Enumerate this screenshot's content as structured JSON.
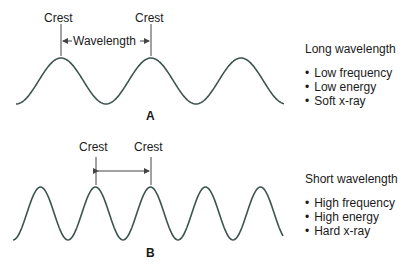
{
  "colors": {
    "wave": "#3d5450",
    "marker": "#444444",
    "text": "#1a1a1a"
  },
  "panel_a": {
    "letter": "A",
    "crest_left": "Crest",
    "crest_right": "Crest",
    "span_label": "Wavelength",
    "wave": {
      "start_x": 16,
      "crest_y": 58,
      "trough_y": 104,
      "wavelength_px": 90,
      "end_x": 284
    },
    "info": {
      "title": "Long wavelength",
      "items": [
        "Low frequency",
        "Low energy",
        "Soft x-ray"
      ]
    }
  },
  "panel_b": {
    "letter": "B",
    "crest_left": "Crest",
    "crest_right": "Crest",
    "span_label": "",
    "wave": {
      "start_x": 13,
      "crest_y": 187,
      "trough_y": 240,
      "wavelength_px": 55,
      "end_x": 283
    },
    "info": {
      "title": "Short wavelength",
      "items": [
        "High frequency",
        "High energy",
        "Hard x-ray"
      ]
    }
  }
}
